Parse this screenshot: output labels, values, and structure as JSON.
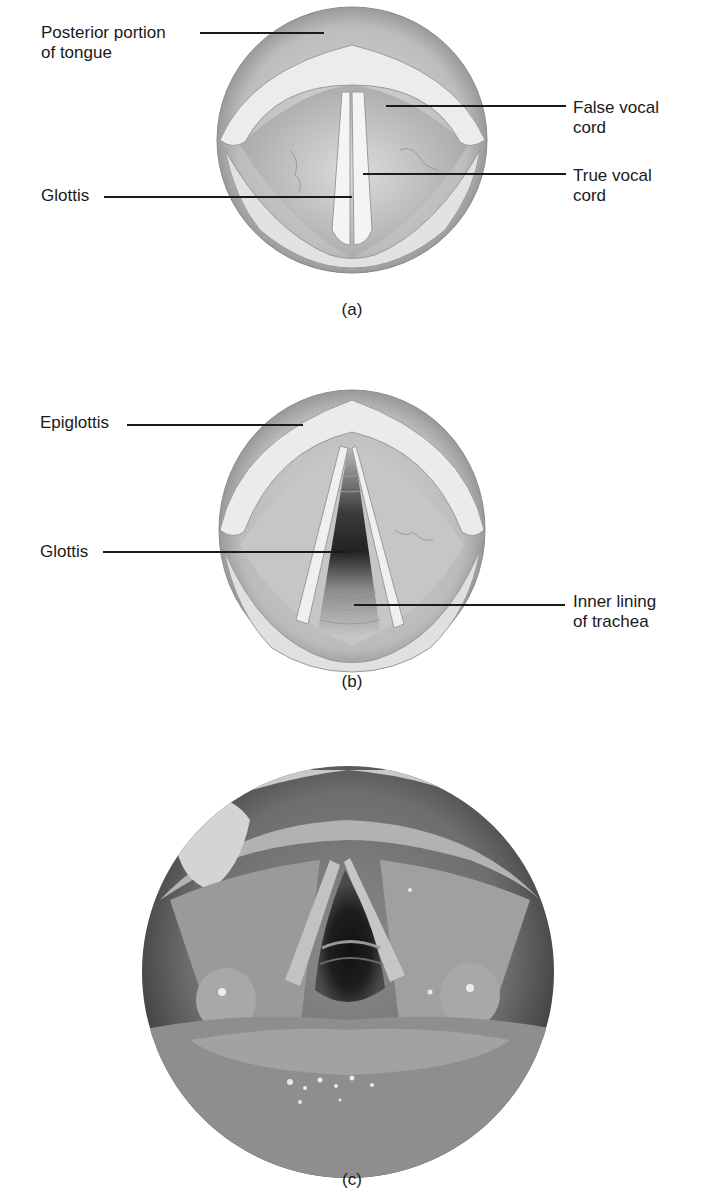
{
  "figure": {
    "panels": [
      {
        "id": "a",
        "caption": "(a)",
        "description": "Illustration of larynx viewed from above with vocal cords closed",
        "labels": [
          {
            "text": "Posterior portion\nof tongue",
            "side": "left"
          },
          {
            "text": "False vocal\ncord",
            "side": "right"
          },
          {
            "text": "Glottis",
            "side": "left"
          },
          {
            "text": "True vocal\ncord",
            "side": "right"
          }
        ]
      },
      {
        "id": "b",
        "caption": "(b)",
        "description": "Illustration of larynx viewed from above with vocal cords open",
        "labels": [
          {
            "text": "Epiglottis",
            "side": "left"
          },
          {
            "text": "Glottis",
            "side": "left"
          },
          {
            "text": "Inner lining\nof trachea",
            "side": "right"
          }
        ]
      },
      {
        "id": "c",
        "caption": "(c)",
        "description": "Laryngoscope photograph of the vocal cords and glottis",
        "labels": []
      }
    ]
  }
}
